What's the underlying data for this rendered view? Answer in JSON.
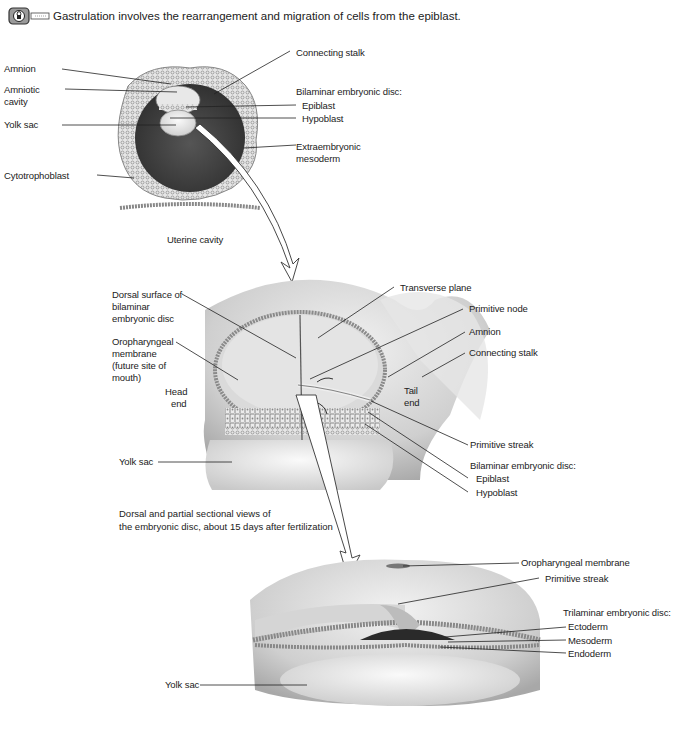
{
  "header": {
    "icon": "objective-badge-icon",
    "text": "Gastrulation involves the rearrangement and migration of cells from the epiblast."
  },
  "panel1": {
    "labels": {
      "amnion": "Amnion",
      "amniotic_cavity_1": "Amniotic",
      "amniotic_cavity_2": "cavity",
      "yolk_sac": "Yolk sac",
      "cytotrophoblast": "Cytotrophoblast",
      "connecting_stalk": "Connecting stalk",
      "bilaminar_title": "Bilaminar embryonic disc:",
      "epiblast": "Epiblast",
      "hypoblast": "Hypoblast",
      "extraembryonic_1": "Extraembryonic",
      "extraembryonic_2": "mesoderm",
      "uterine_cavity": "Uterine cavity"
    }
  },
  "panel2": {
    "labels": {
      "dorsal_surface_1": "Dorsal surface of",
      "dorsal_surface_2": "bilaminar",
      "dorsal_surface_3": "embryonic disc",
      "oropharyngeal_1": "Oropharyngeal",
      "oropharyngeal_2": "membrane",
      "oropharyngeal_3": "(future site of",
      "oropharyngeal_4": "mouth)",
      "head_end_1": "Head",
      "head_end_2": "end",
      "tail_end_1": "Tail",
      "tail_end_2": "end",
      "yolk_sac": "Yolk sac",
      "transverse_plane": "Transverse plane",
      "primitive_node": "Primitive node",
      "amnion": "Amnion",
      "connecting_stalk": "Connecting stalk",
      "primitive_streak": "Primitive streak",
      "bilaminar_title": "Bilaminar embryonic disc:",
      "epiblast": "Epiblast",
      "hypoblast": "Hypoblast"
    },
    "caption_1": "Dorsal and partial sectional views of",
    "caption_2": "the embryonic disc, about 15 days after fertilization"
  },
  "panel3": {
    "labels": {
      "oropharyngeal_membrane": "Oropharyngeal membrane",
      "primitive_streak": "Primitive streak",
      "trilaminar_title": "Trilaminar embryonic disc:",
      "ectoderm": "Ectoderm",
      "mesoderm": "Mesoderm",
      "endoderm": "Endoderm",
      "yolk_sac": "Yolk sac"
    }
  },
  "colors": {
    "tissue_dark": "#3a3a3a",
    "tissue_mid": "#9a9a9a",
    "tissue_light": "#d9d9d9",
    "leader_line": "#222222"
  }
}
